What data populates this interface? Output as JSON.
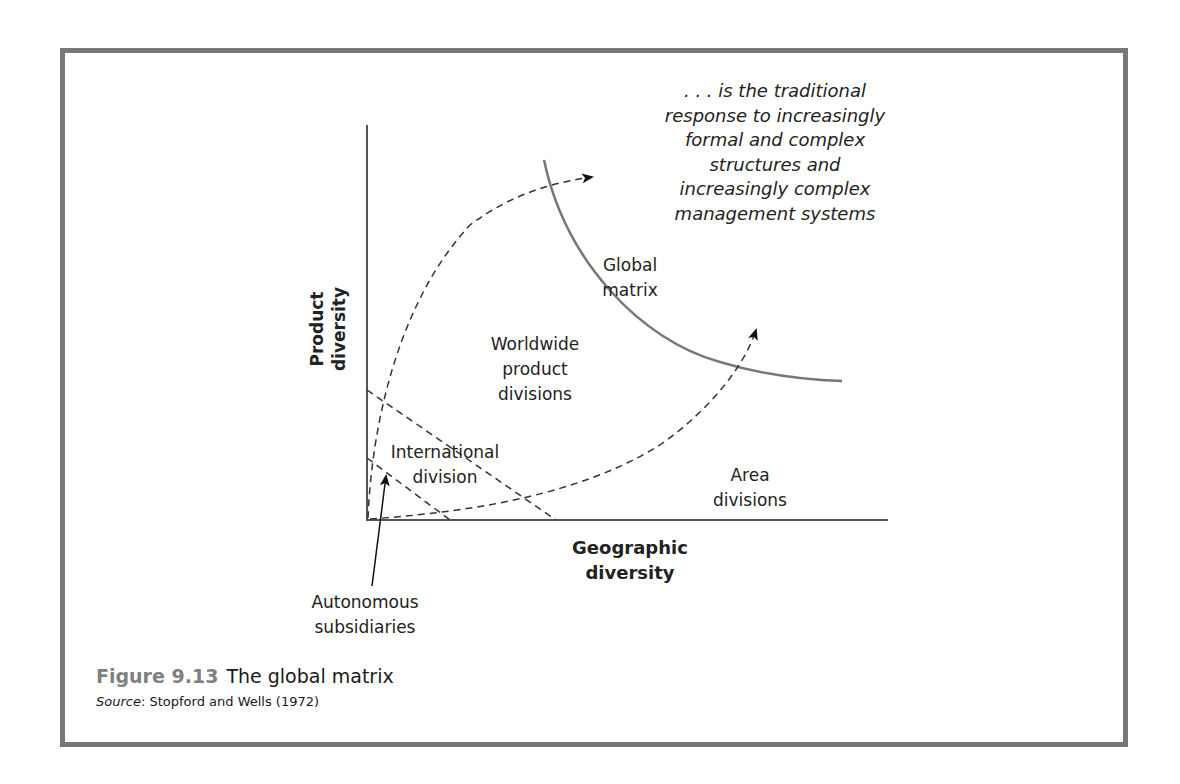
{
  "figure": {
    "number": "Figure 9.13",
    "title": "The global matrix",
    "source_label": "Source",
    "source_text": ": Stopford and Wells (1972)"
  },
  "axes": {
    "y_label_line1": "Product",
    "y_label_line2": "diversity",
    "x_label_line1": "Geographic",
    "x_label_line2": "diversity"
  },
  "regions": {
    "global_matrix": [
      "Global",
      "matrix"
    ],
    "worldwide_product": [
      "Worldwide",
      "product",
      "divisions"
    ],
    "international": [
      "International",
      "division"
    ],
    "area": [
      "Area",
      "divisions"
    ],
    "autonomous": [
      "Autonomous",
      "subsidiaries"
    ]
  },
  "annotation": [
    ". . . is the traditional",
    "response to increasingly",
    "formal and complex",
    "structures and",
    "increasingly complex",
    "management systems"
  ],
  "colors": {
    "frame": "#777777",
    "axis": "#555555",
    "curve": "#777777",
    "dashed": "#333333",
    "figure_number": "#808080"
  }
}
